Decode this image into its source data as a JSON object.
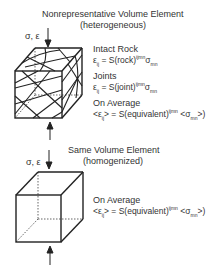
{
  "top_panel": {
    "title": "Nonrepresentative Volume Element",
    "subtitle": "(heterogeneous)",
    "load_label": "σ, ε",
    "intact_rock": {
      "label": "Intact Rock",
      "eq_lhs": "ε",
      "eq_lhs_sub": "ij",
      "eq_mid": " = S(rock)",
      "eq_sup": "ijmn",
      "eq_rhs": "σ",
      "eq_rhs_sub": "mn"
    },
    "joints": {
      "label": "Joints",
      "eq_lhs": "ε",
      "eq_lhs_sub": "ij",
      "eq_mid": " = S(joint)",
      "eq_sup": "ijmn",
      "eq_rhs": "σ",
      "eq_rhs_sub": "mn"
    },
    "average": {
      "label": "On Average",
      "eq_lhs": "<ε",
      "eq_lhs_sub": "ij",
      "eq_mid": "> = S(equivalent)",
      "eq_sup": "ijmn",
      "eq_rhs": " <σ",
      "eq_rhs_sub": "mn",
      "eq_end": ">)"
    }
  },
  "bottom_panel": {
    "title": "Same Volume Element",
    "subtitle": "(homogenized)",
    "load_label": "σ, ε",
    "average": {
      "label": "On Average",
      "eq_lhs": "<ε",
      "eq_lhs_sub": "ij",
      "eq_mid": "> = S(equivalent)",
      "eq_sup": "ijmn",
      "eq_rhs": " <σ",
      "eq_rhs_sub": "mn",
      "eq_end": ">)"
    }
  }
}
